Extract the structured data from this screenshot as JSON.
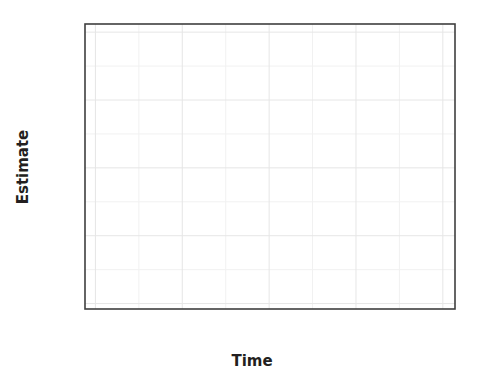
{
  "chart_data": {
    "type": "line",
    "title": "",
    "subtitle": "",
    "xlabel": "Time",
    "ylabel": "Estimate",
    "xlim": [
      -30,
      1035
    ],
    "ylim": [
      -0.02,
      1.03
    ],
    "xticks": [
      0,
      250,
      500,
      750,
      1000
    ],
    "xtick_labels": [
      "0",
      "250",
      "500",
      "750",
      "1000"
    ],
    "yticks": [
      0.0,
      0.25,
      0.5,
      0.75,
      1.0
    ],
    "ytick_labels": [
      "0.00",
      "0.25",
      "0.50",
      "0.75",
      "1.00"
    ],
    "grid": true,
    "grid_minor": true,
    "legend": "none",
    "annotations": [],
    "series": [
      {
        "name": "Estimate",
        "style": "step",
        "color": "#1a1a1a",
        "line_width": 2.4,
        "x": [
          8,
          18,
          26,
          34,
          42,
          52,
          60,
          70,
          80,
          92,
          104,
          116,
          128,
          140,
          152,
          164,
          176,
          188,
          200,
          212,
          224,
          236,
          248,
          258,
          268,
          280,
          292,
          304,
          316,
          328,
          340,
          352,
          364,
          376,
          388,
          400,
          412,
          424,
          436,
          448,
          460,
          472,
          484,
          496,
          508,
          520,
          532,
          546,
          560,
          574,
          588,
          602,
          616,
          630,
          646,
          662,
          678,
          694,
          710,
          726,
          742,
          758,
          774,
          790,
          806,
          824,
          842,
          860,
          878,
          900,
          930,
          960,
          1000,
          1020
        ],
        "y": [
          1.0,
          0.993,
          0.985,
          0.978,
          0.972,
          0.963,
          0.957,
          0.95,
          0.942,
          0.934,
          0.925,
          0.915,
          0.903,
          0.893,
          0.88,
          0.868,
          0.856,
          0.843,
          0.83,
          0.816,
          0.801,
          0.786,
          0.772,
          0.76,
          0.75,
          0.737,
          0.722,
          0.707,
          0.692,
          0.676,
          0.66,
          0.648,
          0.64,
          0.63,
          0.615,
          0.6,
          0.585,
          0.57,
          0.556,
          0.542,
          0.528,
          0.513,
          0.498,
          0.482,
          0.466,
          0.45,
          0.437,
          0.424,
          0.412,
          0.4,
          0.388,
          0.375,
          0.362,
          0.352,
          0.341,
          0.33,
          0.32,
          0.313,
          0.307,
          0.3,
          0.29,
          0.276,
          0.262,
          0.25,
          0.238,
          0.222,
          0.208,
          0.195,
          0.182,
          0.168,
          0.15,
          0.135,
          0.122,
          0.118
        ]
      }
    ],
    "confidence_band": {
      "name": "95% Confidence Interval",
      "color": "#cccccc",
      "lower": [
        1.0,
        0.986,
        0.975,
        0.966,
        0.958,
        0.946,
        0.938,
        0.929,
        0.919,
        0.909,
        0.898,
        0.886,
        0.872,
        0.86,
        0.845,
        0.831,
        0.817,
        0.802,
        0.787,
        0.772,
        0.755,
        0.739,
        0.723,
        0.71,
        0.699,
        0.685,
        0.669,
        0.653,
        0.637,
        0.62,
        0.603,
        0.59,
        0.581,
        0.57,
        0.554,
        0.538,
        0.522,
        0.507,
        0.492,
        0.477,
        0.462,
        0.447,
        0.432,
        0.416,
        0.4,
        0.384,
        0.371,
        0.358,
        0.346,
        0.334,
        0.322,
        0.31,
        0.297,
        0.287,
        0.277,
        0.266,
        0.256,
        0.249,
        0.243,
        0.236,
        0.227,
        0.214,
        0.201,
        0.19,
        0.179,
        0.164,
        0.151,
        0.139,
        0.127,
        0.114,
        0.098,
        0.085,
        0.074,
        0.071
      ],
      "upper": [
        1.0,
        0.999,
        0.995,
        0.99,
        0.986,
        0.98,
        0.976,
        0.971,
        0.965,
        0.959,
        0.952,
        0.944,
        0.934,
        0.926,
        0.915,
        0.905,
        0.895,
        0.884,
        0.873,
        0.86,
        0.847,
        0.833,
        0.821,
        0.81,
        0.801,
        0.789,
        0.775,
        0.761,
        0.747,
        0.732,
        0.717,
        0.706,
        0.699,
        0.69,
        0.676,
        0.662,
        0.648,
        0.633,
        0.62,
        0.607,
        0.594,
        0.579,
        0.564,
        0.548,
        0.532,
        0.516,
        0.503,
        0.49,
        0.478,
        0.466,
        0.454,
        0.44,
        0.427,
        0.417,
        0.405,
        0.394,
        0.384,
        0.377,
        0.371,
        0.364,
        0.353,
        0.338,
        0.323,
        0.31,
        0.297,
        0.28,
        0.265,
        0.251,
        0.237,
        0.222,
        0.202,
        0.185,
        0.17,
        0.165
      ]
    }
  },
  "axes": {
    "x_title": "Time",
    "y_title": "Estimate",
    "x_tick_labels": [
      "0",
      "250",
      "500",
      "750",
      "1000"
    ],
    "y_tick_labels": [
      "0.00",
      "0.25",
      "0.50",
      "0.75",
      "1.00"
    ]
  },
  "colors": {
    "line": "#1a1a1a",
    "band": "#cccccc",
    "border": "#3f3f3f",
    "grid_major": "#e6e6e6",
    "grid_minor": "#f1f1f1",
    "text": "#231f20",
    "background": "#ffffff"
  }
}
